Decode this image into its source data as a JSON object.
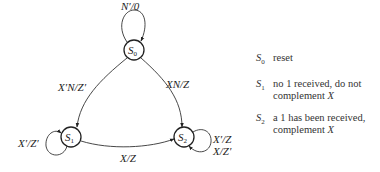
{
  "diagram": {
    "type": "state-diagram",
    "nodes": [
      {
        "id": "S0",
        "label": "S",
        "sub": "0"
      },
      {
        "id": "S1",
        "label": "S",
        "sub": "1"
      },
      {
        "id": "S2",
        "label": "S",
        "sub": "2"
      }
    ],
    "edges": [
      {
        "from": "S0",
        "to": "S0",
        "label": "N′/0"
      },
      {
        "from": "S0",
        "to": "S1",
        "label": "X′N/Z′"
      },
      {
        "from": "S0",
        "to": "S2",
        "label": "XN/Z"
      },
      {
        "from": "S1",
        "to": "S1",
        "label": "X′/Z′"
      },
      {
        "from": "S1",
        "to": "S2",
        "label": "X/Z"
      },
      {
        "from": "S2",
        "to": "S2",
        "label_line1": "X′/Z",
        "label_line2": "X/Z′"
      }
    ]
  },
  "legend": [
    {
      "sym": "S",
      "sub": "0",
      "desc": "reset",
      "desc_tail": ""
    },
    {
      "sym": "S",
      "sub": "1",
      "desc": "no 1 received, do not complement ",
      "desc_tail": "X"
    },
    {
      "sym": "S",
      "sub": "2",
      "desc": "a 1 has been received, complement ",
      "desc_tail": "X"
    }
  ]
}
